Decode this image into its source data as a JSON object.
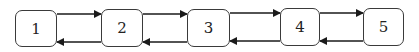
{
  "diagram": {
    "type": "doubly-linked-list",
    "nodes": [
      {
        "id": "1",
        "label": "1"
      },
      {
        "id": "2",
        "label": "2"
      },
      {
        "id": "3",
        "label": "3"
      },
      {
        "id": "4",
        "label": "4"
      },
      {
        "id": "5",
        "label": "5"
      }
    ],
    "edges": [
      {
        "from": "1",
        "to": "2",
        "direction": "forward"
      },
      {
        "from": "2",
        "to": "1",
        "direction": "backward"
      },
      {
        "from": "2",
        "to": "3",
        "direction": "forward"
      },
      {
        "from": "3",
        "to": "2",
        "direction": "backward"
      },
      {
        "from": "3",
        "to": "4",
        "direction": "forward"
      },
      {
        "from": "4",
        "to": "3",
        "direction": "backward"
      },
      {
        "from": "4",
        "to": "5",
        "direction": "forward"
      },
      {
        "from": "5",
        "to": "4",
        "direction": "backward"
      }
    ],
    "colors": {
      "stroke": "#3a3a3a",
      "arrow": "#1a1a1a",
      "background": "#ffffff"
    }
  }
}
